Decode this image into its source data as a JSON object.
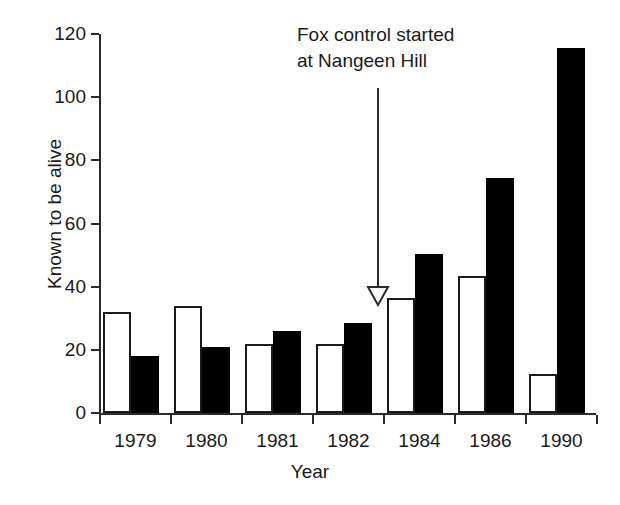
{
  "chart_data": {
    "type": "bar",
    "title": "",
    "xlabel": "Year",
    "ylabel": "Known to be alive",
    "categories": [
      "1979",
      "1980",
      "1981",
      "1982",
      "1984",
      "1986",
      "1990"
    ],
    "series": [
      {
        "name": "open-bars",
        "style": "open",
        "values": [
          32,
          34,
          22,
          22,
          36.5,
          43.5,
          12.5
        ]
      },
      {
        "name": "filled-bars",
        "style": "filled",
        "values": [
          18,
          21,
          26,
          28.5,
          50.5,
          74.5,
          115.5
        ]
      }
    ],
    "ylim": [
      0,
      120
    ],
    "yticks": [
      0,
      20,
      40,
      60,
      80,
      100,
      120
    ],
    "ytick_labels": [
      "0",
      "20",
      "40",
      "60",
      "80",
      "100",
      "120"
    ],
    "grid": false,
    "legend": "none",
    "annotations": [
      {
        "name": "fox-control-annotation",
        "text_line1": "Fox control started",
        "text_line2": "at Nangeen Hill",
        "arrow": "down",
        "points_between_categories": "1982/1984"
      }
    ],
    "colors": {
      "open_fill": "#ffffff",
      "open_stroke": "#1a1a1a",
      "filled_fill": "#000000",
      "axis": "#2b2b2b",
      "text": "#1a1a1a",
      "background": "#ffffff"
    }
  }
}
